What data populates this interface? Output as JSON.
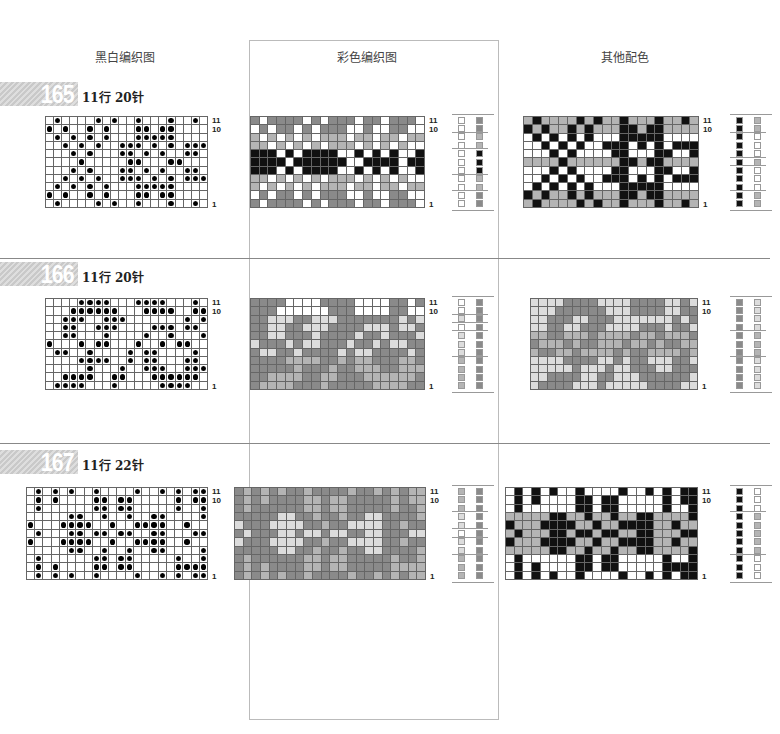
{
  "headers": {
    "bw": "黑白编织图",
    "color": "彩色编织图",
    "alt": "其他配色"
  },
  "palette": {
    "W": "#ffffff",
    "L": "#dcdcdc",
    "M": "#b4b4b4",
    "D": "#8a8a8a",
    "K": "#111111"
  },
  "patterns": [
    {
      "number": "165",
      "spec": "11行 20针",
      "rows": 11,
      "cols": 20,
      "row_labels": [
        "11",
        "10",
        "1"
      ],
      "bw": [
        ".#....#.#..#...#..#.",
        "#.#..#.#...##.##....",
        ".#.#.#.#...#####....",
        "..#.#.#..###.#.#.###",
        "...#.#...##.#.#..##.",
        "....#.....##...##...",
        "...#.#...##.#.#..##.",
        "..#.#.#..###.#.#.###",
        ".#.#.#.#...#####....",
        "#.#..#.#...##.##....",
        ".#....#.#..#...#..#."
      ],
      "color": [
        "DWDDDDWDWDDDWDDWDDDW",
        "WDWDDWDWDDDWWDWWDDWW",
        "MWMWMWMWMMMWMMWMMWMM",
        "MMWMWMWMWMMMWMWMWMWW",
        "KKKWKWKKKKWWKWKWKWWK",
        "KKKKWKKKKKKWWKKKKWKK",
        "KKKWKWKKKKWWKWKWKWWK",
        "MMWMWMWMWMMMWMWMWMWW",
        "MWMWMWMWMMMWMMWMMWMM",
        "WDWDDWDWDDDWWDWWDDWW",
        "DWDDDDWDWDDDWDDWDDDW"
      ],
      "alt": [
        "MKMMMMKMKMMKMMMKMMKM",
        "KMKMMKMKMMMKKMKKMMMM",
        "WKWKWKWKWWWKKKKKWWWW",
        "WWKWKWKWWKKKWKWKWKKK",
        "WWWKWKWWWWKKWWWKKWWK",
        "MMMMKMMMMMMKKMKKMMMM",
        "WWWKWKWWWWKKWWWKKWWK",
        "WWKWKWKWWKKKWKWKWKKK",
        "WKWKWKWKWWWKKKKKWWWW",
        "KMKMMKMKMMMKKMKKMMMM",
        "MKMMMMKMKMMKMMMKMMKM"
      ],
      "legend_color": [
        [
          "W",
          "D"
        ],
        [
          "W",
          "D"
        ],
        [
          "W",
          "M"
        ],
        [
          "W",
          "M"
        ],
        [
          "W",
          "K"
        ],
        [
          "W",
          "K"
        ],
        [
          "W",
          "K"
        ],
        [
          "W",
          "M"
        ],
        [
          "W",
          "M"
        ],
        [
          "W",
          "D"
        ],
        [
          "W",
          "D"
        ]
      ],
      "legend_alt": [
        [
          "K",
          "M"
        ],
        [
          "K",
          "M"
        ],
        [
          "K",
          "W"
        ],
        [
          "K",
          "W"
        ],
        [
          "K",
          "W"
        ],
        [
          "K",
          "M"
        ],
        [
          "K",
          "W"
        ],
        [
          "K",
          "W"
        ],
        [
          "K",
          "W"
        ],
        [
          "K",
          "M"
        ],
        [
          "K",
          "M"
        ]
      ]
    },
    {
      "number": "166",
      "spec": "11行 20针",
      "rows": 11,
      "cols": 20,
      "row_labels": [
        "11",
        "10",
        "1"
      ],
      "bw": [
        "....####...####...#.",
        "...######...####..##",
        "..###..###.......#.#",
        "..##..###....###.##.",
        "..##...#....#..#...#",
        "#...#.##...#..#.##..",
        ".##..#....#.##....#.",
        "....####..#.##...##.",
        ".....#...#..###..###",
        "..####..##...######.",
        ".####...#.....####.."
      ],
      "color": [
        "DDDDWWWWDDDDWWWWDDWD",
        "DDDWWWWWWDDDWWWWDDWW",
        "DDLLLDDLLLDDDDDDDLDL",
        "DDLLDDLLLDDDDLLLDLLD",
        "DDLLDDDLDDDDLDDLDDDL",
        "LDDDLDLLDDDLDDLDLLDD",
        "DLLDDLDDDDLDLLDDDDLD",
        "DDDDMMMMDDMDMMDDDMMD",
        "DDDDDMDDDMDDMMMDDMMM",
        "DDMMMMDDMMDDDMMMMMMD",
        "DMMMMDDDMDDDDDMMMMDD"
      ],
      "alt": [
        "LLLLDDDDLLLLDDDDLLDL",
        "LLLDDDDDDLLLDDDDLLDD",
        "LLDDDLLDDDLLLLLLLDLD",
        "LLDDLLDDDLLLLDDDLDDL",
        "MMDDMMMDMMMMDMMDMMMD",
        "DMMMDMDDMMMDMMDMDDMM",
        "MDDMMDMMMMDMDDMMMMDM",
        "LLLLDDDDLLDLDDLLLDDL",
        "LLLLLDLLLDLLDDDLLDDD",
        "LLDDDDLLDDLLLDDDDDDL",
        "LDDDDLLLDLLLLLDDDDLL"
      ],
      "legend_color": [
        [
          "W",
          "D"
        ],
        [
          "W",
          "D"
        ],
        [
          "L",
          "D"
        ],
        [
          "W",
          "D"
        ],
        [
          "L",
          "D"
        ],
        [
          "L",
          "D"
        ],
        [
          "L",
          "D"
        ],
        [
          "M",
          "D"
        ],
        [
          "M",
          "D"
        ],
        [
          "M",
          "D"
        ],
        [
          "M",
          "D"
        ]
      ],
      "legend_alt": [
        [
          "D",
          "L"
        ],
        [
          "D",
          "L"
        ],
        [
          "D",
          "L"
        ],
        [
          "D",
          "L"
        ],
        [
          "D",
          "M"
        ],
        [
          "D",
          "M"
        ],
        [
          "D",
          "M"
        ],
        [
          "D",
          "L"
        ],
        [
          "D",
          "L"
        ],
        [
          "D",
          "L"
        ],
        [
          "D",
          "L"
        ]
      ]
    },
    {
      "number": "167",
      "spec": "11行 22针",
      "rows": 11,
      "cols": 22,
      "row_labels": [
        "11",
        "10",
        "1"
      ],
      "bw": [
        ".#.#.#..#....#..#.#.##",
        ".#.#....##.##.....#.##",
        ".#......##.##.....#..#",
        ".....##..#..#..##....#",
        "#...####..#..####..#..",
        ".#...##.##.##..##...##",
        "#...####..#..####..#..",
        ".....##..#..#..##....#",
        ".#......##.##.....#..#",
        ".#.#....##.##.....####",
        ".#.#.#..#....#..#.#.##"
      ],
      "color": [
        "DMDMDMDDMDDDDMDDMDMDMM",
        "DMDMDDDDMMDMMDDDDDMDMM",
        "DMDDDDDDMMDMMDDDDDMDDM",
        "DDDDDLLDDMDDMDDLLDDDDM",
        "LDDDLLLLDDMDDLLLLDDMDD",
        "DLDDDLLDLLDLLDDLLDDDLL",
        "LDDDLLLLDDMDDLLLLDDMDD",
        "DDDDDLLDDMDDMDDLLDDDDM",
        "DMDDDDDDMMDMMDDDDDMDDM",
        "DMDMDDDDMMDMMDDDDDMMMM",
        "DMDMDMDDMDDDDMDDMDMDMM"
      ],
      "alt": [
        "WKWKWKWWKWWWWKWWKWKWKK",
        "WKWKWWWWKKWKKWWWWWKWKK",
        "WKWWWWWWKKWKKWWWWWKWWK",
        "MMMMMKKMMKMMKMMKKMMMMK",
        "KMMMKKKKMMKMMKKKKMMKMM",
        "MKMMMKKMKKMKKMMKKMMMKK",
        "KMMMKKKKMMKMMKKKKMMKMM",
        "MMMMMKKMMKMMKMMKKMMMMK",
        "WKWWWWWWKKWKKWWWWWKWWK",
        "WKWKWWWWKKWKKWWWWWKKKK",
        "WKWKWKWWKWWWWKWWKWKWKK"
      ],
      "legend_color": [
        [
          "M",
          "D"
        ],
        [
          "M",
          "D"
        ],
        [
          "M",
          "D"
        ],
        [
          "L",
          "D"
        ],
        [
          "L",
          "D"
        ],
        [
          "W",
          "D"
        ],
        [
          "L",
          "D"
        ],
        [
          "L",
          "D"
        ],
        [
          "M",
          "D"
        ],
        [
          "M",
          "D"
        ],
        [
          "M",
          "D"
        ]
      ],
      "legend_alt": [
        [
          "K",
          "W"
        ],
        [
          "K",
          "W"
        ],
        [
          "K",
          "W"
        ],
        [
          "K",
          "M"
        ],
        [
          "K",
          "M"
        ],
        [
          "K",
          "M"
        ],
        [
          "K",
          "M"
        ],
        [
          "K",
          "M"
        ],
        [
          "K",
          "W"
        ],
        [
          "K",
          "W"
        ],
        [
          "K",
          "W"
        ]
      ]
    }
  ]
}
